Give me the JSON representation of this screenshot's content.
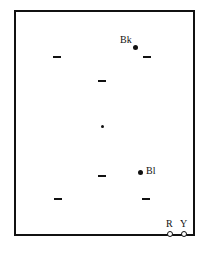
{
  "diagram": {
    "type": "board-layout",
    "frame": {
      "left": 14,
      "top": 10,
      "width": 181,
      "height": 226,
      "border_color": "#111111"
    },
    "dashes": [
      {
        "id": "dash-1",
        "x": 53,
        "y": 56
      },
      {
        "id": "dash-2",
        "x": 143,
        "y": 56
      },
      {
        "id": "dash-3",
        "x": 98,
        "y": 80
      },
      {
        "id": "dash-4",
        "x": 98,
        "y": 175
      },
      {
        "id": "dash-5",
        "x": 54,
        "y": 198
      },
      {
        "id": "dash-6",
        "x": 142,
        "y": 198
      }
    ],
    "center_dot": {
      "x": 102,
      "y": 125
    },
    "markers": [
      {
        "id": "bk",
        "label": "Bk",
        "dot_x": 134,
        "dot_y": 46,
        "label_x": 120,
        "label_y": 35
      },
      {
        "id": "bl",
        "label": "Bl",
        "dot_x": 139,
        "dot_y": 171,
        "label_x": 146,
        "label_y": 166
      }
    ],
    "corner_markers": [
      {
        "id": "r",
        "label": "R",
        "ring_x": 168,
        "ring_y": 232,
        "label_x": 167,
        "label_y": 219
      },
      {
        "id": "y",
        "label": "Y",
        "ring_x": 182,
        "ring_y": 232,
        "label_x": 181,
        "label_y": 219
      }
    ]
  }
}
